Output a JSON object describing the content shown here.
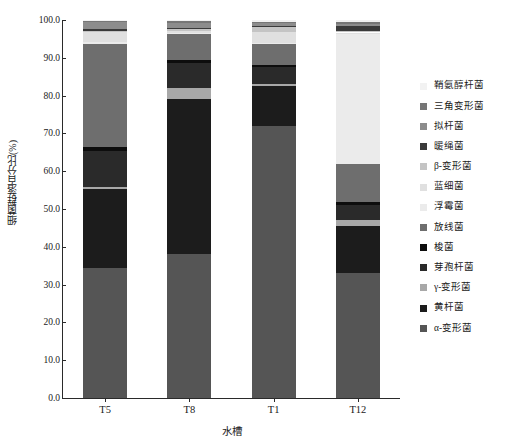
{
  "chart_data": {
    "type": "bar",
    "subtype": "stacked-bar-100-percent",
    "title": "",
    "xlabel": "水槽",
    "ylabel": "细菌群落百分比(%)",
    "ylim": [
      0.0,
      100.0
    ],
    "ytick_step": 10.0,
    "grid": false,
    "legend_position": "right",
    "categories": [
      "T5",
      "T8",
      "T1",
      "T12"
    ],
    "ytick_labels": [
      "0.0",
      "10.0",
      "20.0",
      "30.0",
      "40.0",
      "50.0",
      "60.0",
      "70.0",
      "80.0",
      "90.0",
      "100.0"
    ],
    "series": [
      {
        "name": "α-变形菌",
        "color": "#555555",
        "values": [
          34.5,
          38.0,
          72.0,
          33.0
        ]
      },
      {
        "name": "黄杆菌",
        "color": "#1c1c1c",
        "values": [
          21.0,
          41.0,
          10.5,
          12.5
        ]
      },
      {
        "name": "γ-变形菌",
        "color": "#a8a8a8",
        "values": [
          0.7,
          3.0,
          0.5,
          1.5
        ]
      },
      {
        "name": "芽孢杆菌",
        "color": "#2a2a2a",
        "values": [
          9.5,
          6.5,
          4.5,
          4.0
        ]
      },
      {
        "name": "梭菌",
        "color": "#0d0d0d",
        "values": [
          1.0,
          0.8,
          0.6,
          0.8
        ]
      },
      {
        "name": "放线菌",
        "color": "#6e6e6e",
        "values": [
          27.5,
          7.0,
          5.5,
          10.0
        ]
      },
      {
        "name": "浮霉菌",
        "color": "#ebebeb",
        "values": [
          0.4,
          0.3,
          0.3,
          34.5
        ]
      },
      {
        "name": "蓝细菌",
        "color": "#e0e0e0",
        "values": [
          2.6,
          0.4,
          3.0,
          0.4
        ]
      },
      {
        "name": "β-变形菌",
        "color": "#c4c4c4",
        "values": [
          0.5,
          0.6,
          1.2,
          0.5
        ]
      },
      {
        "name": "暖绳菌",
        "color": "#3a3a3a",
        "values": [
          0.4,
          0.4,
          0.4,
          1.2
        ]
      },
      {
        "name": "拟杆菌",
        "color": "#8c8c8c",
        "values": [
          2.0,
          1.2,
          0.7,
          0.5
        ]
      },
      {
        "name": "三角变形菌",
        "color": "#767676",
        "values": [
          0.3,
          0.5,
          0.4,
          0.6
        ]
      },
      {
        "name": "鞘氨醇杆菌",
        "color": "#f2f2f2",
        "values": [
          0.1,
          0.3,
          0.4,
          0.5
        ]
      }
    ],
    "legend_order_top_to_bottom": [
      "鞘氨醇杆菌",
      "三角变形菌",
      "拟杆菌",
      "暖绳菌",
      "β-变形菌",
      "蓝细菌",
      "浮霉菌",
      "放线菌",
      "梭菌",
      "芽孢杆菌",
      "γ-变形菌",
      "黄杆菌",
      "α-变形菌"
    ]
  }
}
